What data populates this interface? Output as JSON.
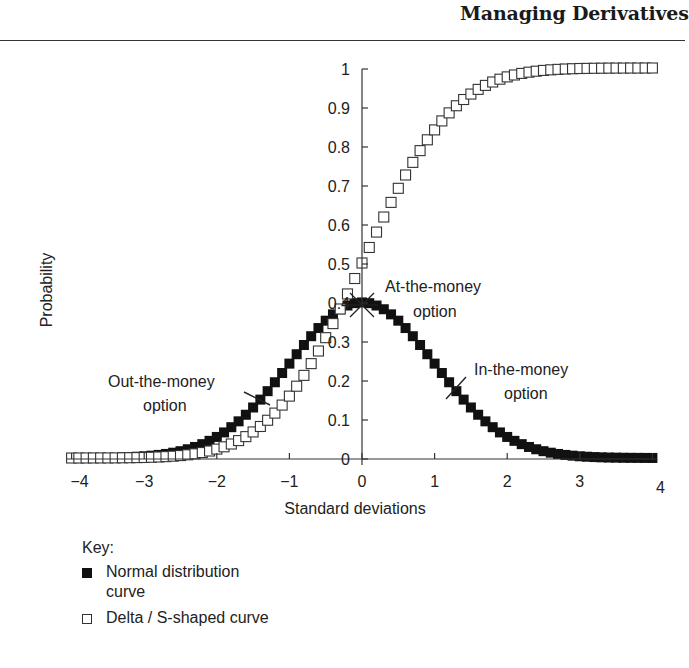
{
  "header": {
    "running_head": "Managing Derivatives"
  },
  "chart_data": {
    "type": "scatter",
    "title": "",
    "xlabel": "Standard deviations",
    "ylabel": "Probability",
    "xlim": [
      -4,
      4
    ],
    "ylim": [
      0,
      1
    ],
    "x_ticks": [
      -4,
      -3,
      -2,
      -1,
      0,
      1,
      2,
      3,
      4
    ],
    "x_tick_labels": [
      "−4",
      "−3",
      "−2",
      "−1",
      "0",
      "1",
      "2",
      "3",
      "4"
    ],
    "y_ticks": [
      0,
      0.1,
      0.2,
      0.3,
      0.4,
      0.5,
      0.6,
      0.7,
      0.8,
      0.9,
      1
    ],
    "y_tick_labels": [
      "0",
      "0.1",
      "0.2",
      "0.3",
      "0.4",
      "0.5",
      "0.6",
      "0.7",
      "0.8",
      "0.9",
      "1"
    ],
    "grid": false,
    "legend_position": "below chart",
    "x": [
      -4.0,
      -3.9,
      -3.8,
      -3.7,
      -3.6,
      -3.5,
      -3.4,
      -3.3,
      -3.2,
      -3.1,
      -3.0,
      -2.9,
      -2.8,
      -2.7,
      -2.6,
      -2.5,
      -2.4,
      -2.3,
      -2.2,
      -2.1,
      -2.0,
      -1.9,
      -1.8,
      -1.7,
      -1.6,
      -1.5,
      -1.4,
      -1.3,
      -1.2,
      -1.1,
      -1.0,
      -0.9,
      -0.8,
      -0.7,
      -0.6,
      -0.5,
      -0.4,
      -0.3,
      -0.2,
      -0.1,
      0.0,
      0.1,
      0.2,
      0.3,
      0.4,
      0.5,
      0.6,
      0.7,
      0.8,
      0.9,
      1.0,
      1.1,
      1.2,
      1.3,
      1.4,
      1.5,
      1.6,
      1.7,
      1.8,
      1.9,
      2.0,
      2.1,
      2.2,
      2.3,
      2.4,
      2.5,
      2.6,
      2.7,
      2.8,
      2.9,
      3.0,
      3.1,
      3.2,
      3.3,
      3.4,
      3.5,
      3.6,
      3.7,
      3.8,
      3.9,
      4.0
    ],
    "series": [
      {
        "name": "Normal distribution curve",
        "marker": "filled-square",
        "x_range": [
          -3.3,
          4.0
        ],
        "values": [
          0.0001,
          0.0002,
          0.0003,
          0.0004,
          0.0006,
          0.0009,
          0.0012,
          0.0017,
          0.0024,
          0.0033,
          0.0044,
          0.006,
          0.0079,
          0.0104,
          0.0136,
          0.0175,
          0.0224,
          0.0283,
          0.0355,
          0.044,
          0.054,
          0.0656,
          0.079,
          0.094,
          0.1109,
          0.1295,
          0.1497,
          0.1714,
          0.1942,
          0.2179,
          0.242,
          0.2661,
          0.2897,
          0.3123,
          0.3332,
          0.3521,
          0.3683,
          0.3814,
          0.391,
          0.397,
          0.3989,
          0.397,
          0.391,
          0.3814,
          0.3683,
          0.3521,
          0.3332,
          0.3123,
          0.2897,
          0.2661,
          0.242,
          0.2179,
          0.1942,
          0.1714,
          0.1497,
          0.1295,
          0.1109,
          0.094,
          0.079,
          0.0656,
          0.054,
          0.044,
          0.0355,
          0.0283,
          0.0224,
          0.0175,
          0.0136,
          0.0104,
          0.0079,
          0.006,
          0.0044,
          0.0033,
          0.0024,
          0.0017,
          0.0012,
          0.0009,
          0.0006,
          0.0004,
          0.0003,
          0.0002,
          0.0001
        ]
      },
      {
        "name": "Delta / S-shaped curve",
        "marker": "open-square",
        "values": [
          0.0,
          0.0,
          0.0001,
          0.0001,
          0.0002,
          0.0002,
          0.0003,
          0.0005,
          0.0007,
          0.001,
          0.0013,
          0.0019,
          0.0026,
          0.0035,
          0.0047,
          0.0062,
          0.0082,
          0.0107,
          0.0139,
          0.0179,
          0.0228,
          0.0287,
          0.0359,
          0.0446,
          0.0548,
          0.0668,
          0.0808,
          0.0968,
          0.1151,
          0.1357,
          0.1587,
          0.1841,
          0.2119,
          0.242,
          0.2743,
          0.3085,
          0.3446,
          0.3821,
          0.4207,
          0.4602,
          0.5,
          0.5398,
          0.5793,
          0.6179,
          0.6554,
          0.6915,
          0.7257,
          0.758,
          0.7881,
          0.8159,
          0.8413,
          0.8643,
          0.8849,
          0.9032,
          0.9192,
          0.9332,
          0.9452,
          0.9554,
          0.9641,
          0.9713,
          0.9772,
          0.9821,
          0.9861,
          0.9893,
          0.9918,
          0.9938,
          0.9953,
          0.9965,
          0.9974,
          0.9981,
          0.9987,
          0.999,
          0.9993,
          0.9995,
          0.9997,
          0.9998,
          0.9998,
          0.9999,
          0.9999,
          1.0,
          1.0
        ]
      }
    ],
    "annotations": [
      {
        "text_lines": [
          "At-the-money",
          "option"
        ],
        "x": 0.0,
        "y": 0.4,
        "marker": "star"
      },
      {
        "text_lines": [
          "Out-the-money",
          "option"
        ],
        "x": -1.4,
        "y": 0.15,
        "marker": "slash"
      },
      {
        "text_lines": [
          "In-the-money",
          "option"
        ],
        "x": 1.3,
        "y": 0.17,
        "marker": "slash"
      }
    ],
    "colors": {
      "filled_marker": "#111111",
      "open_marker_stroke": "#333333",
      "axis": "#333333"
    }
  },
  "key": {
    "title": "Key:",
    "items": [
      {
        "symbol": "filled-square",
        "label_lines": [
          "Normal distribution",
          "curve"
        ]
      },
      {
        "symbol": "open-square",
        "label_lines": [
          "Delta / S-shaped curve"
        ]
      }
    ]
  }
}
